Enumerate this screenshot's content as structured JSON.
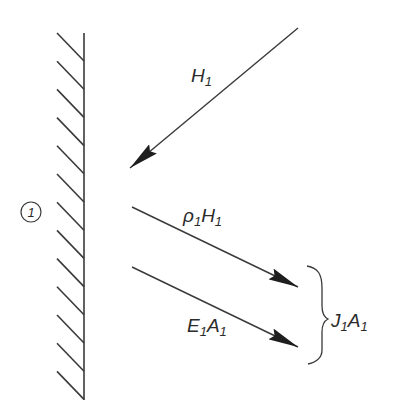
{
  "diagram": {
    "region_label": "1",
    "colors": {
      "stroke": "#3a3a3a",
      "arrowhead": "#1e1e1e",
      "text": "#2b2b2b",
      "background": "#ffffff"
    },
    "wall": {
      "x": 84,
      "y_top": 33,
      "y_bottom": 400,
      "hatch_count": 13,
      "hatch_spacing": 28.2,
      "hatch_dx": -27,
      "hatch_dy": -28
    },
    "arrows": [
      {
        "name": "incident",
        "label_main": "H",
        "label_sub": "1",
        "x1": 298,
        "y1": 28,
        "x2": 130,
        "y2": 168
      },
      {
        "name": "reflected",
        "label_main": "ρ",
        "label_sub": "1",
        "label_main2": "H",
        "label_sub2": "1",
        "x1": 132,
        "y1": 207,
        "x2": 298,
        "y2": 287
      },
      {
        "name": "emitted",
        "label_main": "E",
        "label_sub": "1",
        "label_main2": "A",
        "label_sub2": "1",
        "x1": 132,
        "y1": 267,
        "x2": 298,
        "y2": 347
      }
    ],
    "brace": {
      "label_main": "J",
      "label_sub": "1",
      "label_main2": "A",
      "label_sub2": "1"
    }
  }
}
